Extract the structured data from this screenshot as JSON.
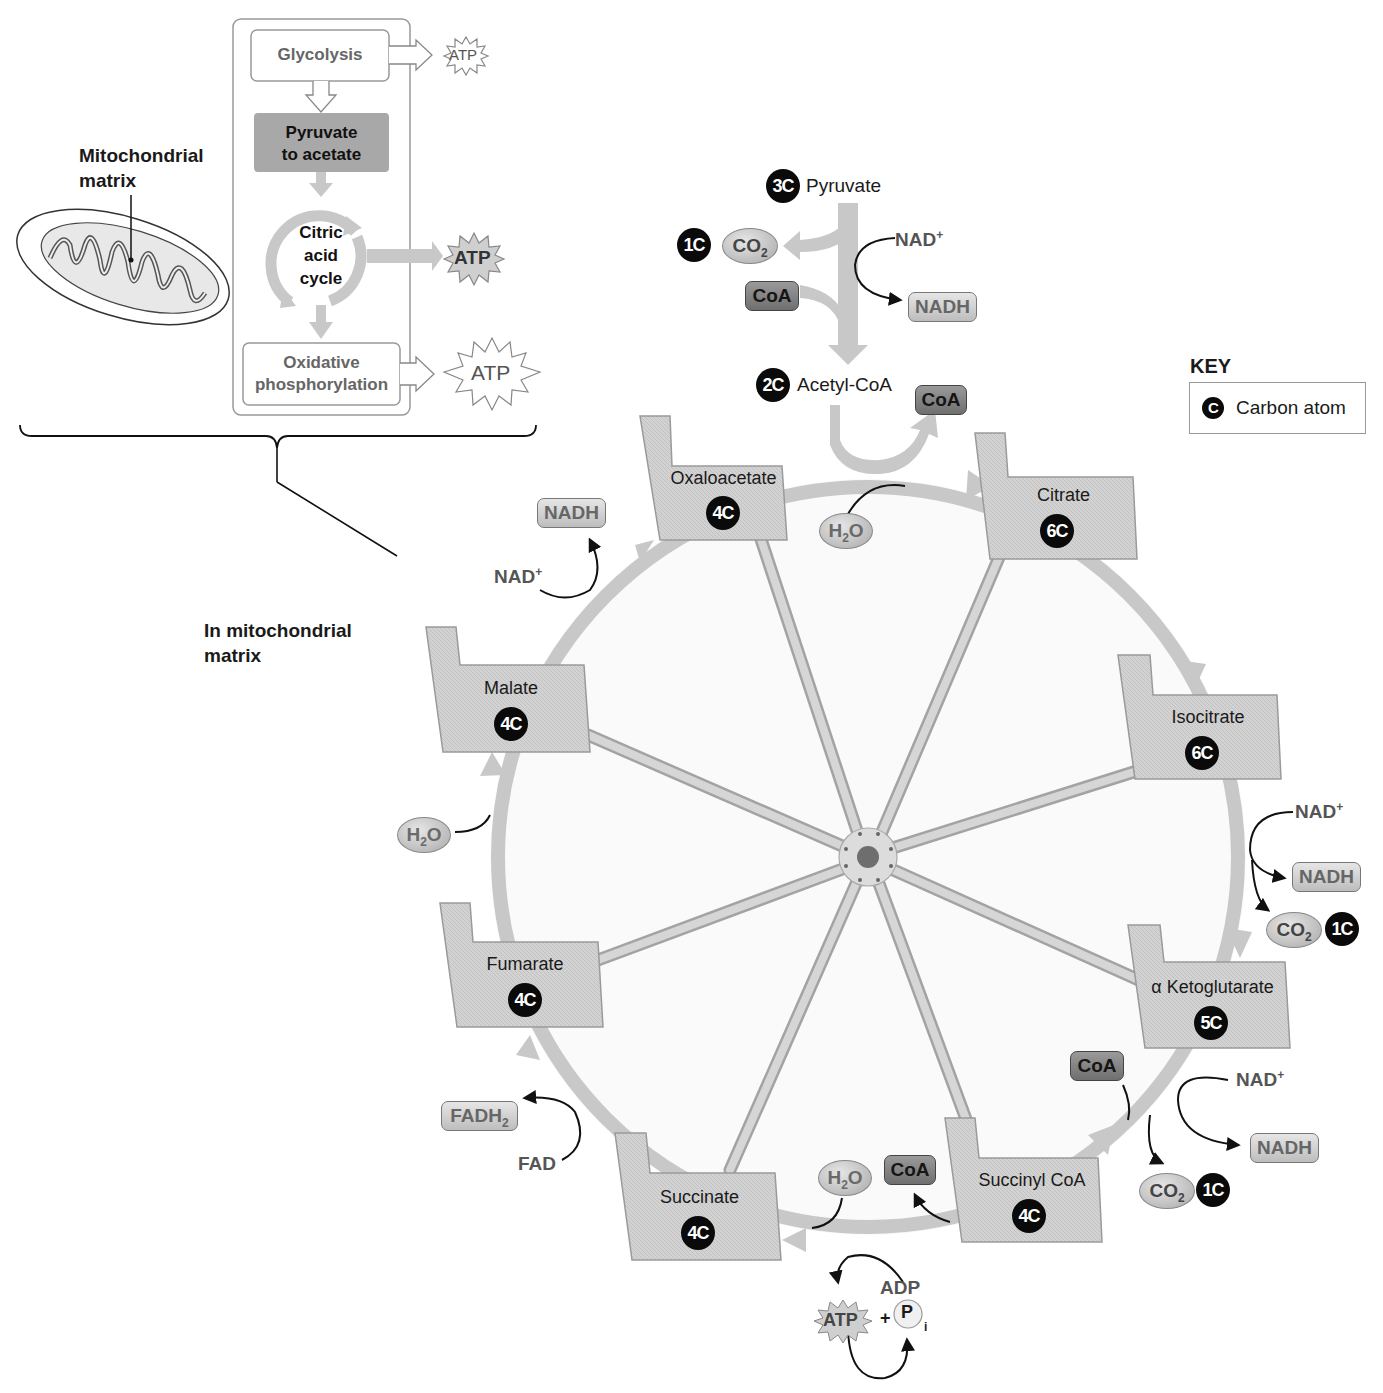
{
  "overview": {
    "mitochondrion_label": "Mitochondrial matrix",
    "mitochondrion_label_lines": [
      "Mitochondrial",
      "matrix"
    ],
    "steps": {
      "glycolysis": "Glycolysis",
      "pyruvate_to_acetate_lines": [
        "Pyruvate",
        "to acetate"
      ],
      "citric_acid_cycle_lines": [
        "Citric",
        "acid",
        "cycle"
      ],
      "oxidative_phosphorylation_lines": [
        "Oxidative",
        "phosphorylation"
      ]
    },
    "atp_outputs": [
      "ATP",
      "ATP",
      "ATP"
    ],
    "location_label_lines": [
      "In mitochondrial",
      "matrix"
    ]
  },
  "entry": {
    "pyruvate": {
      "carbons": "3C",
      "name": "Pyruvate"
    },
    "co2": {
      "carbons": "1C",
      "name": "CO",
      "sub": "2"
    },
    "coa_in": "CoA",
    "nad_plus": "NAD",
    "nad_sup": "+",
    "nadh": "NADH",
    "acetyl_coa": {
      "carbons": "2C",
      "name": "Acetyl-CoA"
    },
    "coa_out": "CoA"
  },
  "key": {
    "title": "KEY",
    "symbol": "C",
    "description": "Carbon atom"
  },
  "cycle": {
    "intermediates": [
      {
        "name": "Oxaloacetate",
        "carbons": "4C"
      },
      {
        "name": "Citrate",
        "carbons": "6C"
      },
      {
        "name": "Isocitrate",
        "carbons": "6C"
      },
      {
        "name": "α Ketoglutarate",
        "carbons": "5C"
      },
      {
        "name": "Succinyl CoA",
        "carbons": "4C"
      },
      {
        "name": "Succinate",
        "carbons": "4C"
      },
      {
        "name": "Fumarate",
        "carbons": "4C"
      },
      {
        "name": "Malate",
        "carbons": "4C"
      }
    ],
    "inputs_outputs": {
      "citrate_step": {
        "water": "H",
        "water_sub": "2",
        "water_end": "O"
      },
      "isocitrate_step": {
        "nad_plus": "NAD",
        "sup": "+",
        "nadh": "NADH",
        "co2": "CO",
        "co2_sub": "2",
        "carbons": "1C"
      },
      "ketoglutarate_step": {
        "coa": "CoA",
        "nad_plus": "NAD",
        "sup": "+",
        "nadh": "NADH",
        "co2": "CO",
        "co2_sub": "2",
        "carbons": "1C"
      },
      "succinyl_step": {
        "water": "H",
        "water_sub": "2",
        "water_end": "O",
        "coa": "CoA",
        "atp": "ATP",
        "plus": "+",
        "adp": "ADP",
        "pi": "P",
        "pi_sub": "i"
      },
      "succinate_step": {
        "fad": "FAD",
        "fadh2": "FADH",
        "fadh2_sub": "2"
      },
      "fumarate_step": {
        "water": "H",
        "water_sub": "2",
        "water_end": "O"
      },
      "malate_step": {
        "nad_plus": "NAD",
        "sup": "+",
        "nadh": "NADH"
      }
    }
  },
  "colors": {
    "arrow_gray": "#c8c8c8",
    "node_fill": "#cfcfcf",
    "node_border": "#9a9a9a",
    "carbon_badge": "#0a0a0a",
    "pyruvate_box": "#a8a8a8"
  }
}
